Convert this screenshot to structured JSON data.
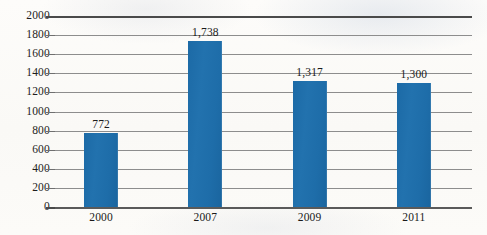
{
  "chart_data": {
    "type": "bar",
    "title": "",
    "subtitle": "",
    "xlabel": "",
    "ylabel": "",
    "categories": [
      "2000",
      "2007",
      "2009",
      "2011"
    ],
    "values": [
      772,
      1738,
      1317,
      1300
    ],
    "value_labels": [
      "772",
      "1,738",
      "1,317",
      "1,300"
    ],
    "ylim": [
      0,
      2000
    ],
    "ytick_interval": 200,
    "ytick_labels": [
      "0",
      "200",
      "400",
      "600",
      "800",
      "1000",
      "1200",
      "1400",
      "1600",
      "1800",
      "2000"
    ],
    "ytick_values": [
      0,
      200,
      400,
      600,
      800,
      1000,
      1200,
      1400,
      1600,
      1800,
      2000
    ],
    "grid": true,
    "grid_axis": "y",
    "legend": false,
    "legend_position": "none",
    "series": [
      {
        "name": "",
        "values": [
          772,
          1738,
          1317,
          1300
        ]
      }
    ],
    "colors": {
      "bar": "#1f6ca8",
      "gridline": "#8d8d8d",
      "axis": "#4a4a4a",
      "text": "#1a1a1a",
      "background": "#fbfaf7"
    }
  }
}
